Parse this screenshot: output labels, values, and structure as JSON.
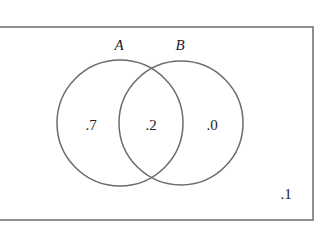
{
  "diagram": {
    "type": "venn",
    "sets": [
      {
        "name": "A",
        "only_value": ".7"
      },
      {
        "name": "B",
        "only_value": ".0"
      }
    ],
    "intersection_value": ".2",
    "outside_value": ".1",
    "colors": {
      "stroke": "#6b6b6b",
      "text": "#222222",
      "background": "#ffffff"
    }
  }
}
